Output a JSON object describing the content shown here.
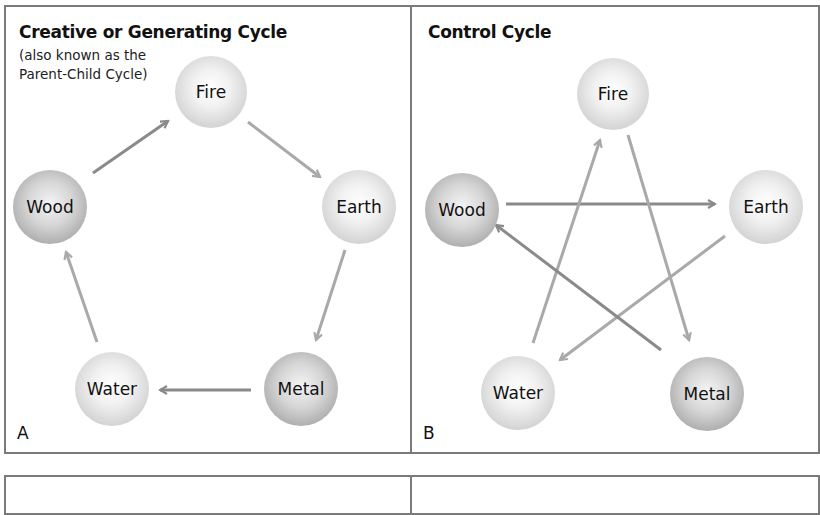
{
  "panels": {
    "a": {
      "title": "Creative or Generating Cycle",
      "subtitle_line1": "(also known as the",
      "subtitle_line2": "Parent-Child Cycle)",
      "letter": "A",
      "nodes": {
        "fire": "Fire",
        "earth": "Earth",
        "metal": "Metal",
        "water": "Water",
        "wood": "Wood"
      },
      "sequence": [
        "Wood",
        "Fire",
        "Earth",
        "Metal",
        "Water",
        "Wood"
      ]
    },
    "b": {
      "title": "Control Cycle",
      "letter": "B",
      "nodes": {
        "fire": "Fire",
        "earth": "Earth",
        "metal": "Metal",
        "water": "Water",
        "wood": "Wood"
      },
      "relations": [
        {
          "from": "Wood",
          "to": "Earth"
        },
        {
          "from": "Earth",
          "to": "Water"
        },
        {
          "from": "Water",
          "to": "Fire"
        },
        {
          "from": "Fire",
          "to": "Metal"
        },
        {
          "from": "Metal",
          "to": "Wood"
        }
      ]
    }
  },
  "colors": {
    "border": "#7a7a7a",
    "arrow_light": "#a9a9a9",
    "arrow_dark": "#8a8a8a",
    "text": "#111111"
  }
}
